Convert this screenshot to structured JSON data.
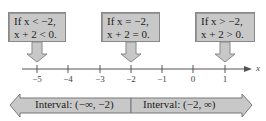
{
  "callouts": [
    {
      "line1": "If x < −2,",
      "line2": "x + 2 < 0.",
      "points_to": -5
    },
    {
      "line1": "If x = −2,",
      "line2": "x + 2 = 0.",
      "points_to": -2
    },
    {
      "line1": "If x > −2,",
      "line2": "x + 2 > 0.",
      "points_to": 1
    }
  ],
  "number_line": {
    "variable": "x",
    "ticks": [
      "−5",
      "−4",
      "−3",
      "−2",
      "−1",
      "0",
      "1"
    ]
  },
  "intervals": [
    {
      "label": "Interval: (−∞, −2)"
    },
    {
      "label": "Interval: (−2, ∞)"
    }
  ],
  "colors": {
    "box_fill": "#c8c8c8",
    "box_border": "#888888",
    "line": "#555555"
  }
}
